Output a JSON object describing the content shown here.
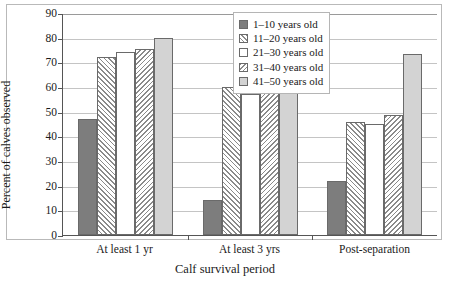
{
  "chart_data": {
    "type": "bar",
    "title": "",
    "xlabel": "Calf survival period",
    "ylabel": "Percent of calves observed",
    "ylim": [
      0,
      90
    ],
    "ytick_step": 10,
    "yticks": [
      0,
      10,
      20,
      30,
      40,
      50,
      60,
      70,
      80,
      90
    ],
    "grid": true,
    "legend_position": "top-right",
    "categories": [
      "At least 1 yr",
      "At least 3 yrs",
      "Post-separation"
    ],
    "series": [
      {
        "name": "1–10 years old",
        "pattern": "solid-gray",
        "color": "#7d7d7d",
        "values": [
          47,
          14,
          22
        ]
      },
      {
        "name": "11–20 years old",
        "pattern": "forward-hatch",
        "color": "#ffffff",
        "values": [
          72,
          60,
          46
        ]
      },
      {
        "name": "21–30 years old",
        "pattern": "white",
        "color": "#ffffff",
        "values": [
          74,
          57,
          45
        ]
      },
      {
        "name": "31–40 years old",
        "pattern": "backward-hatch",
        "color": "#ffffff",
        "values": [
          75.5,
          65.5,
          48.5
        ]
      },
      {
        "name": "41–50 years old",
        "pattern": "light-gray",
        "color": "#d3d3d3",
        "values": [
          80,
          80,
          73.5
        ]
      }
    ]
  }
}
